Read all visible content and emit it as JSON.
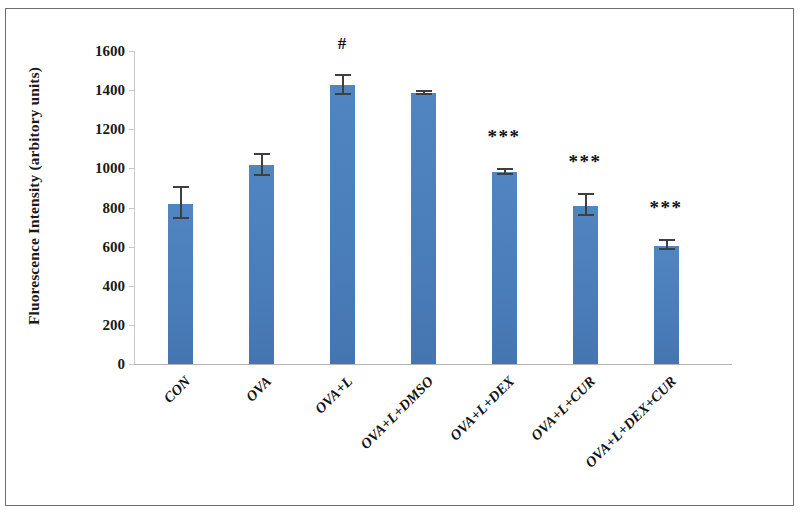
{
  "chart_data": {
    "type": "bar",
    "title": "",
    "xlabel": "",
    "ylabel": "Fluorescence Intensity (arbitory units)",
    "ylim": [
      0,
      1600
    ],
    "y_ticks": [
      0,
      200,
      400,
      600,
      800,
      1000,
      1200,
      1400,
      1600
    ],
    "y_tick_labels": [
      "0",
      "200",
      "400",
      "600",
      "800",
      "1000",
      "1200",
      "1400",
      "1600"
    ],
    "grid": false,
    "legend": "none",
    "categories": [
      "CON",
      "OVA",
      "OVA+L",
      "OVA+L+DMSO",
      "OVA+L+DEX",
      "OVA+L+CUR",
      "OVA+L+DEX+CUR"
    ],
    "values": [
      820,
      1015,
      1425,
      1385,
      980,
      810,
      605
    ],
    "errors": [
      80,
      55,
      48,
      8,
      12,
      52,
      22
    ],
    "annotations": [
      "",
      "",
      "#",
      "",
      "***",
      "***",
      "***"
    ],
    "bar_color": "#4a7ebb",
    "error_color": "#3f3f3f"
  }
}
